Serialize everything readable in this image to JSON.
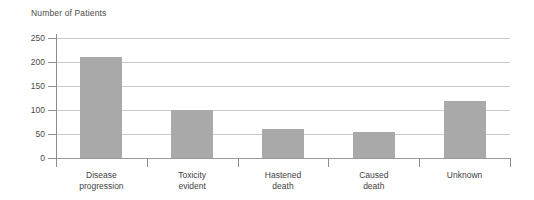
{
  "chart_data": {
    "type": "bar",
    "title": "Number of Patients",
    "xlabel": "",
    "ylabel": "Number of Patients",
    "categories": [
      "Disease\nprogression",
      "Toxicity\nevident",
      "Hastened\ndeath",
      "Caused\ndeath",
      "Unknown"
    ],
    "values": [
      210,
      100,
      60,
      55,
      118
    ],
    "ylim": [
      0,
      250
    ],
    "yticks": [
      0,
      50,
      100,
      150,
      200,
      250
    ],
    "ytick_labels": [
      "0",
      "50",
      "100",
      "150",
      "200",
      "250"
    ],
    "grid": true,
    "legend": "none",
    "bar_color": "#a9a9a9",
    "gridline_color": "#c9c9c9",
    "axis_color": "#8d8d8d"
  },
  "axis": {
    "title": "Number of Patients",
    "tick_labels": [
      "250",
      "200",
      "150",
      "100",
      "50",
      "0"
    ]
  },
  "categories": [
    {
      "line1": "Disease",
      "line2": "progression"
    },
    {
      "line1": "Toxicity",
      "line2": "evident"
    },
    {
      "line1": "Hastened",
      "line2": "death"
    },
    {
      "line1": "Caused",
      "line2": "death"
    },
    {
      "line1": "Unknown",
      "line2": ""
    }
  ]
}
